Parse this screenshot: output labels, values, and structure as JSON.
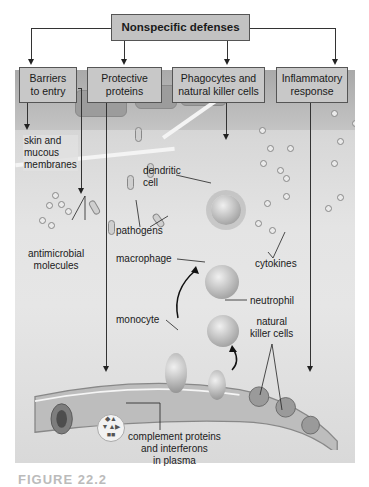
{
  "title": "Nonspecific defenses",
  "categories": [
    {
      "label": "Barriers\nto entry",
      "line1": "Barriers",
      "line2": "to entry"
    },
    {
      "label": "Protective proteins",
      "line1": "Protective",
      "line2": "proteins"
    },
    {
      "label": "Phagocytes and natural killer cells",
      "line1": "Phagocytes and",
      "line2": "natural killer cells"
    },
    {
      "label": "Inflammatory response",
      "line1": "Inflammatory",
      "line2": "response"
    }
  ],
  "labels": {
    "skin": [
      "skin and",
      "mucous",
      "membranes"
    ],
    "antimicrobial": [
      "antimicrobial",
      "molecules"
    ],
    "dendritic": [
      "dendritic",
      "cell"
    ],
    "pathogens": "pathogens",
    "macrophage": "macrophage",
    "monocyte": "monocyte",
    "neutrophil": "neutrophil",
    "natural_killer": [
      "natural",
      "killer cells"
    ],
    "cytokines": "cytokines",
    "complement": [
      "complement proteins",
      "and interferons",
      "in plasma"
    ]
  },
  "caption": "FIGURE 22.2"
}
